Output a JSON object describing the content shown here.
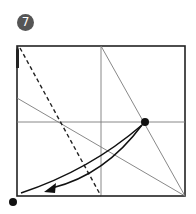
{
  "step": {
    "number": "7",
    "badge_color": "#555555"
  },
  "colors": {
    "paper_edge": "#222222",
    "crease": "#7a7a7a",
    "valley_fold": "#222222",
    "arrow": "#111111",
    "dot": "#111111"
  },
  "diagram": {
    "square": {
      "x": 17,
      "y": 46,
      "width": 168,
      "height": 150
    },
    "creases": [
      {
        "name": "vertical-center-crease",
        "x1": 101,
        "y1": 46,
        "x2": 101,
        "y2": 196
      },
      {
        "name": "horizontal-center-crease",
        "x1": 17,
        "y1": 122,
        "x2": 185,
        "y2": 122
      },
      {
        "name": "diagonal-crease-top-to-corner",
        "x1": 101,
        "y1": 46,
        "x2": 185,
        "y2": 196
      },
      {
        "name": "diagonal-crease-left-to-corner",
        "x1": 17,
        "y1": 98,
        "x2": 185,
        "y2": 196
      }
    ],
    "valley_fold_line": {
      "x1": 20,
      "y1": 48,
      "x2": 101,
      "y2": 196
    },
    "reference_dot": {
      "cx": 145,
      "cy": 122,
      "r": 4
    },
    "target_dot": {
      "cx": 13,
      "cy": 202,
      "r": 4
    }
  }
}
